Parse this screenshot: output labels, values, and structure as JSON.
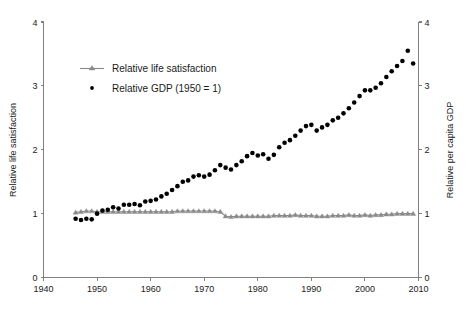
{
  "chart_data": {
    "type": "scatter",
    "title": "",
    "xlabel": "",
    "ylabel": "Relative life satisfaction",
    "y2label": "Relative per capita GDP",
    "xlim": [
      1940,
      2010
    ],
    "ylim": [
      0,
      4
    ],
    "y2lim": [
      0,
      4
    ],
    "grid": false,
    "legend_position": "upper-left-inside",
    "xticks": [
      1940,
      1950,
      1960,
      1970,
      1980,
      1990,
      2000,
      2010
    ],
    "yticks": [
      0,
      1,
      2,
      3,
      4
    ],
    "y2ticks": [
      0,
      1,
      2,
      3,
      4
    ],
    "series": [
      {
        "name": "Relative life satisfaction",
        "marker": "triangle",
        "style": "line+marker",
        "color": "#8a8a8a",
        "axis": "left",
        "x": [
          1946,
          1947,
          1948,
          1949,
          1950,
          1951,
          1952,
          1953,
          1954,
          1955,
          1956,
          1957,
          1958,
          1959,
          1960,
          1961,
          1962,
          1963,
          1964,
          1965,
          1966,
          1967,
          1968,
          1969,
          1970,
          1971,
          1972,
          1973,
          1974,
          1975,
          1976,
          1977,
          1978,
          1979,
          1980,
          1981,
          1982,
          1983,
          1984,
          1985,
          1986,
          1987,
          1988,
          1989,
          1990,
          1991,
          1992,
          1993,
          1994,
          1995,
          1996,
          1997,
          1998,
          1999,
          2000,
          2001,
          2002,
          2003,
          2004,
          2005,
          2006,
          2007,
          2008,
          2009
        ],
        "y": [
          1.02,
          1.03,
          1.04,
          1.04,
          1.03,
          1.03,
          1.03,
          1.03,
          1.03,
          1.03,
          1.03,
          1.03,
          1.03,
          1.03,
          1.03,
          1.03,
          1.03,
          1.03,
          1.03,
          1.04,
          1.04,
          1.04,
          1.04,
          1.04,
          1.04,
          1.04,
          1.04,
          1.03,
          0.96,
          0.95,
          0.96,
          0.96,
          0.96,
          0.96,
          0.96,
          0.96,
          0.96,
          0.97,
          0.97,
          0.97,
          0.97,
          0.98,
          0.97,
          0.97,
          0.97,
          0.96,
          0.96,
          0.96,
          0.97,
          0.97,
          0.97,
          0.98,
          0.97,
          0.97,
          0.98,
          0.97,
          0.98,
          0.98,
          0.99,
          0.99,
          1.0,
          1.0,
          1.0,
          1.0
        ]
      },
      {
        "name": "Relative GDP (1950 = 1)",
        "marker": "dot",
        "style": "markers",
        "color": "#000000",
        "axis": "right",
        "x": [
          1946,
          1947,
          1948,
          1949,
          1950,
          1951,
          1952,
          1953,
          1954,
          1955,
          1956,
          1957,
          1958,
          1959,
          1960,
          1961,
          1962,
          1963,
          1964,
          1965,
          1966,
          1967,
          1968,
          1969,
          1970,
          1971,
          1972,
          1973,
          1974,
          1975,
          1976,
          1977,
          1978,
          1979,
          1980,
          1981,
          1982,
          1983,
          1984,
          1985,
          1986,
          1987,
          1988,
          1989,
          1990,
          1991,
          1992,
          1993,
          1994,
          1995,
          1996,
          1997,
          1998,
          1999,
          2000,
          2001,
          2002,
          2003,
          2004,
          2005,
          2006,
          2007,
          2008,
          2009
        ],
        "y": [
          0.92,
          0.9,
          0.92,
          0.91,
          1.0,
          1.05,
          1.06,
          1.1,
          1.08,
          1.14,
          1.14,
          1.15,
          1.13,
          1.19,
          1.2,
          1.22,
          1.27,
          1.31,
          1.37,
          1.43,
          1.5,
          1.52,
          1.58,
          1.6,
          1.58,
          1.61,
          1.68,
          1.76,
          1.72,
          1.69,
          1.76,
          1.82,
          1.9,
          1.95,
          1.91,
          1.93,
          1.86,
          1.92,
          2.04,
          2.11,
          2.15,
          2.22,
          2.3,
          2.37,
          2.39,
          2.3,
          2.35,
          2.39,
          2.46,
          2.5,
          2.57,
          2.65,
          2.74,
          2.84,
          2.93,
          2.93,
          2.97,
          3.04,
          3.14,
          3.23,
          3.31,
          3.39,
          3.55,
          3.35
        ]
      }
    ],
    "legend": [
      {
        "label": "Relative life satisfaction",
        "marker": "line-triangle",
        "color": "#8a8a8a"
      },
      {
        "label": "Relative GDP (1950 = 1)",
        "marker": "dot",
        "color": "#000000"
      }
    ],
    "colors": {
      "life_satisfaction": "#8a8a8a",
      "gdp": "#000000",
      "axis": "#808080",
      "text": "#1a1a1a",
      "background": "#ffffff"
    }
  }
}
